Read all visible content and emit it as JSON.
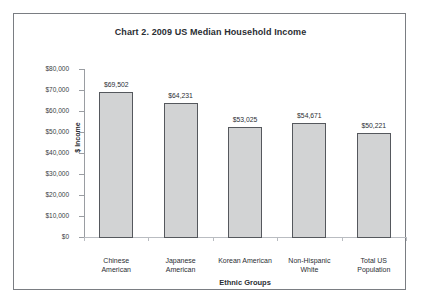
{
  "chart_data": {
    "type": "bar",
    "title": "Chart 2. 2009 US Median Household Income",
    "xlabel": "Ethnic Groups",
    "ylabel": "$ Income",
    "ylim": [
      0,
      80000
    ],
    "ytick_step": 10000,
    "grid": false,
    "legend": false,
    "categories": [
      "Chinese American",
      "Japanese American",
      "Korean American",
      "Non-Hispanic White",
      "Total US Population"
    ],
    "category_lines": [
      [
        "Chinese",
        "American"
      ],
      [
        "Japanese",
        "American"
      ],
      [
        "Korean American"
      ],
      [
        "Non-Hispanic",
        "White"
      ],
      [
        "Total US",
        "Population"
      ]
    ],
    "values": [
      69502,
      64231,
      53025,
      54671,
      50221
    ],
    "value_labels": [
      "$69,502",
      "$64,231",
      "$53,025",
      "$54,671",
      "$50,221"
    ],
    "ytick_labels": [
      "$80,000",
      "$70,000",
      "$60,000",
      "$50,000",
      "$40,000",
      "$30,000",
      "$20,000",
      "$10,000",
      "$0"
    ],
    "ytick_values": [
      80000,
      70000,
      60000,
      50000,
      40000,
      30000,
      20000,
      10000,
      0
    ],
    "colors": {
      "bar_fill": "#d2d3d4",
      "bar_border": "#55585d",
      "axis": "#9a9da2",
      "frame": "#7a7d82",
      "text": "#2b2e33",
      "background": "#ffffff"
    }
  }
}
